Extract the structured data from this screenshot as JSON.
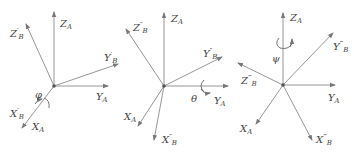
{
  "figure": {
    "panels": [
      {
        "name": "rotation-phi",
        "rotation_symbol": "φ",
        "rotation_axis": "X",
        "labels": {
          "za": "Z",
          "za_sub": "A",
          "zb": "Z",
          "zb_sup": "′",
          "zb_sub": "B",
          "yb": "Y",
          "yb_sup": "′",
          "yb_sub": "B",
          "ya": "Y",
          "ya_sub": "A",
          "xb": "X",
          "xb_sup": "′",
          "xb_sub": "B",
          "xa": "X",
          "xa_sub": "A"
        }
      },
      {
        "name": "rotation-theta",
        "rotation_symbol": "θ",
        "rotation_axis": "Y",
        "labels": {
          "za": "Z",
          "za_sub": "A",
          "zb": "Z",
          "zb_sup": "″",
          "zb_sub": "B",
          "yb": "Y",
          "yb_sup": "″",
          "yb_sub": "B",
          "ya": "Y",
          "ya_sub": "A",
          "xb": "X",
          "xb_sup": "″",
          "xb_sub": "B",
          "xa": "X",
          "xa_sub": "A"
        }
      },
      {
        "name": "rotation-psi",
        "rotation_symbol": "ψ",
        "rotation_axis": "Z",
        "labels": {
          "za": "Z",
          "za_sub": "A",
          "zb": "Z",
          "zb_sup": "‴",
          "zb_sub": "B",
          "yb": "Y",
          "yb_sup": "‴",
          "yb_sub": "B",
          "ya": "Y",
          "ya_sub": "A",
          "xb": "X",
          "xb_sup": "‴",
          "xb_sub": "B",
          "xa": "X",
          "xa_sub": "A"
        }
      }
    ],
    "colors": {
      "axis": "#888888",
      "text": "#444444",
      "origin": "#555555"
    }
  }
}
